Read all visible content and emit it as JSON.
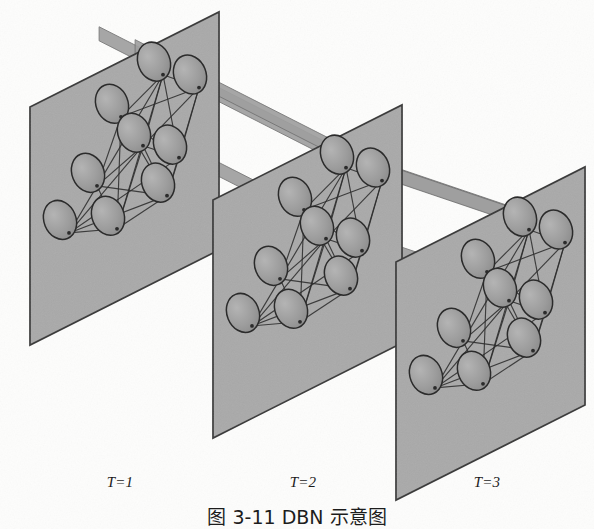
{
  "figure": {
    "kind": "dynamic-bayesian-network-unrolled",
    "slice_labels": [
      {
        "id": "t1",
        "text": "T=1",
        "x": 120,
        "y": 487
      },
      {
        "id": "t2",
        "text": "T=2",
        "x": 303,
        "y": 487
      },
      {
        "id": "t3",
        "text": "T=3",
        "x": 487,
        "y": 487
      }
    ],
    "caption": {
      "text": "图 3-11  DBN 示意图",
      "clipped": true,
      "x": 297,
      "y": 524
    },
    "colors": {
      "plane_fill": "#a9a9a9",
      "plane_edge": "#3a3a3a",
      "node_fill": "#9a9a9a",
      "node_edge": "#2b2b2b",
      "link_stroke": "#2e2e2e",
      "ribbon_fill": "#9f9f9f",
      "ribbon_edge": "#6f6f6f",
      "page_background": "#fdfdfc",
      "text": "#1a1a1a"
    },
    "planes": [
      {
        "id": "plane-t1",
        "label": "T=1",
        "corners": [
          [
            30,
            107
          ],
          [
            219,
            12
          ],
          [
            219,
            250
          ],
          [
            30,
            345
          ]
        ]
      },
      {
        "id": "plane-t2",
        "label": "T=2",
        "corners": [
          [
            213,
            200
          ],
          [
            402,
            105
          ],
          [
            402,
            343
          ],
          [
            213,
            438
          ]
        ]
      },
      {
        "id": "plane-t3",
        "label": "T=3",
        "corners": [
          [
            396,
            262
          ],
          [
            585,
            167
          ],
          [
            585,
            405
          ],
          [
            396,
            500
          ]
        ]
      }
    ],
    "node_layout": {
      "count_per_plane": 9,
      "shape": "ellipse",
      "rx": 16,
      "ry": 20,
      "rotation_deg": -22,
      "offsets": [
        [
          82,
          38
        ],
        [
          124,
          17
        ],
        [
          160,
          48
        ],
        [
          58,
          95
        ],
        [
          104,
          78
        ],
        [
          140,
          108
        ],
        [
          30,
          128
        ],
        [
          78,
          148
        ],
        [
          128,
          140
        ]
      ]
    },
    "edges_per_plane": [
      [
        0,
        1
      ],
      [
        0,
        2
      ],
      [
        0,
        4
      ],
      [
        0,
        5
      ],
      [
        0,
        7
      ],
      [
        0,
        8
      ],
      [
        1,
        2
      ],
      [
        1,
        4
      ],
      [
        1,
        5
      ],
      [
        2,
        5
      ],
      [
        2,
        8
      ],
      [
        3,
        0
      ],
      [
        3,
        1
      ],
      [
        3,
        4
      ],
      [
        3,
        8
      ],
      [
        4,
        5
      ],
      [
        4,
        7
      ],
      [
        4,
        8
      ],
      [
        5,
        8
      ],
      [
        6,
        3
      ],
      [
        6,
        4
      ],
      [
        6,
        5
      ],
      [
        6,
        7
      ],
      [
        6,
        8
      ],
      [
        7,
        8
      ],
      [
        1,
        7
      ],
      [
        2,
        4
      ],
      [
        3,
        7
      ]
    ],
    "temporal_ribbons": {
      "count": 4,
      "note": "Thin flat bands connecting matching nodes between consecutive time slices"
    }
  }
}
